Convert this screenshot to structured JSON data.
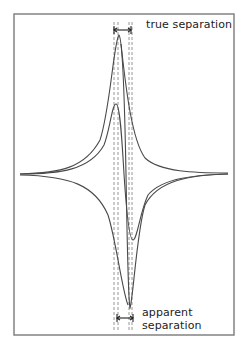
{
  "figure": {
    "type": "derivative-lineshape-separation-diagram",
    "labels": {
      "true_separation": "true separation",
      "apparent_separation_line1": "apparent",
      "apparent_separation_line2": "separation"
    },
    "colors": {
      "line": "#4a4a4a",
      "frame": "#7a7a7a",
      "dashed": "#8a8a8a",
      "background": "#ffffff"
    },
    "frame": {
      "x": 14,
      "y": 14,
      "width": 220,
      "height": 321
    },
    "baseline_y": 174,
    "dashed_lines_x": [
      114,
      118,
      129,
      132
    ],
    "true_separation_marker": {
      "x1": 114,
      "x2": 131,
      "y": 30
    },
    "apparent_separation_marker": {
      "x1": 117,
      "x2": 133,
      "y": 318
    },
    "curves": [
      {
        "name": "resolved-derivative-curve",
        "peak": {
          "x": 119,
          "y": 35
        },
        "trough": {
          "x": 130,
          "y": 308
        }
      },
      {
        "name": "overlapped-derivative-curve",
        "peak": {
          "x": 116,
          "y": 104
        },
        "trough": {
          "x": 133,
          "y": 240
        }
      }
    ]
  }
}
